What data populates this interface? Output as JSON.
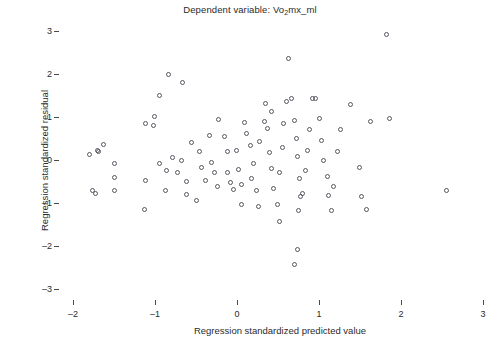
{
  "chart_data": {
    "type": "scatter",
    "title": "Dependent variable: Vo2mx_ml",
    "title_main": "Dependent variable: Vo",
    "title_sub": "2",
    "title_tail": "mx_ml",
    "xlabel": "Regression standardized predicted value",
    "ylabel": "Regression standardized residual",
    "xlim": [
      -2.5,
      3.2
    ],
    "ylim": [
      -3.4,
      3.3
    ],
    "xticks": [
      -2,
      -1,
      0,
      1,
      2,
      3
    ],
    "xticklabels": [
      "–2",
      "–1",
      "0",
      "1",
      "2",
      "3"
    ],
    "yticks": [
      3,
      2,
      1,
      0,
      -1,
      -2,
      -3
    ],
    "yticklabels": [
      "3",
      "2",
      "1",
      "0",
      "–1",
      "–2",
      "–3"
    ],
    "grid": false,
    "legend": false,
    "marker": "open-circle",
    "marker_color": "#55555f",
    "marker_size_px": 5,
    "n_points": 97,
    "points": [
      [
        -1.8,
        0.12
      ],
      [
        -1.76,
        -0.7
      ],
      [
        -1.63,
        0.35
      ],
      [
        -1.7,
        0.23
      ],
      [
        -1.69,
        0.2
      ],
      [
        -1.49,
        -0.07
      ],
      [
        -1.5,
        -0.4
      ],
      [
        -1.5,
        -0.7
      ],
      [
        -1.72,
        -0.79
      ],
      [
        -1.13,
        -1.16
      ],
      [
        -1.12,
        -0.47
      ],
      [
        -1.12,
        0.84
      ],
      [
        -1.01,
        1.02
      ],
      [
        -0.84,
        1.98
      ],
      [
        -0.66,
        1.81
      ],
      [
        -0.94,
        1.51
      ],
      [
        -1.02,
        0.81
      ],
      [
        -0.94,
        -0.07
      ],
      [
        -0.86,
        -0.25
      ],
      [
        -0.87,
        -0.72
      ],
      [
        -0.79,
        0.05
      ],
      [
        -0.73,
        -0.3
      ],
      [
        -0.68,
        -0.02
      ],
      [
        -0.62,
        -0.49
      ],
      [
        -0.61,
        -0.8
      ],
      [
        -0.49,
        -0.95
      ],
      [
        -0.55,
        0.41
      ],
      [
        -0.46,
        0.19
      ],
      [
        -0.43,
        -0.18
      ],
      [
        -0.38,
        -0.47
      ],
      [
        -0.33,
        0.58
      ],
      [
        -0.31,
        -0.05
      ],
      [
        -0.28,
        -0.3
      ],
      [
        -0.24,
        -0.62
      ],
      [
        -0.23,
        0.95
      ],
      [
        -0.15,
        0.55
      ],
      [
        -0.12,
        0.2
      ],
      [
        -0.12,
        -0.3
      ],
      [
        -0.08,
        -0.52
      ],
      [
        -0.04,
        -0.68
      ],
      [
        -0.01,
        0.22
      ],
      [
        0.02,
        -0.22
      ],
      [
        0.05,
        -1.04
      ],
      [
        0.05,
        -0.58
      ],
      [
        0.09,
        0.88
      ],
      [
        0.12,
        0.62
      ],
      [
        0.16,
        0.33
      ],
      [
        0.2,
        -0.08
      ],
      [
        0.18,
        -0.44
      ],
      [
        0.24,
        -0.7
      ],
      [
        0.26,
        -1.08
      ],
      [
        0.28,
        0.43
      ],
      [
        0.33,
        0.9
      ],
      [
        0.35,
        1.32
      ],
      [
        0.37,
        0.74
      ],
      [
        0.4,
        0.18
      ],
      [
        0.42,
        -0.2
      ],
      [
        0.45,
        -0.66
      ],
      [
        0.49,
        -1.04
      ],
      [
        0.52,
        -0.3
      ],
      [
        0.55,
        0.3
      ],
      [
        0.57,
        0.86
      ],
      [
        0.6,
        1.36
      ],
      [
        0.63,
        2.35
      ],
      [
        0.66,
        1.42
      ],
      [
        0.7,
        0.93
      ],
      [
        0.72,
        0.5
      ],
      [
        0.74,
        0.08
      ],
      [
        0.76,
        -0.42
      ],
      [
        0.77,
        -0.86
      ],
      [
        0.75,
        -1.18
      ],
      [
        0.74,
        -2.09
      ],
      [
        0.7,
        -2.42
      ],
      [
        0.8,
        -0.78
      ],
      [
        0.84,
        -0.25
      ],
      [
        0.86,
        0.22
      ],
      [
        0.88,
        0.7
      ],
      [
        0.92,
        1.42
      ],
      [
        0.96,
        1.43
      ],
      [
        1.0,
        0.97
      ],
      [
        1.03,
        0.45
      ],
      [
        1.06,
        -0.02
      ],
      [
        1.1,
        -0.38
      ],
      [
        1.12,
        -0.83
      ],
      [
        1.15,
        -1.18
      ],
      [
        1.18,
        -0.62
      ],
      [
        1.22,
        0.2
      ],
      [
        1.26,
        0.72
      ],
      [
        1.38,
        1.3
      ],
      [
        1.49,
        -0.18
      ],
      [
        1.52,
        -0.86
      ],
      [
        1.58,
        -1.16
      ],
      [
        1.63,
        0.9
      ],
      [
        1.82,
        2.93
      ],
      [
        1.86,
        0.96
      ],
      [
        2.55,
        -0.72
      ],
      [
        0.52,
        -1.42
      ],
      [
        0.42,
        1.13
      ]
    ]
  }
}
